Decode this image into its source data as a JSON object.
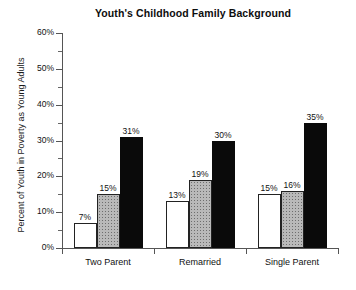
{
  "chart_data": {
    "type": "bar",
    "title": "Youth's Childhood Family Background",
    "xlabel": "",
    "ylabel": "Percent of Youth in Poverty as Young Adults",
    "ylim": [
      0,
      60
    ],
    "ytick_labels": [
      "0%",
      "10%",
      "20%",
      "30%",
      "40%",
      "50%",
      "60%"
    ],
    "ytick_values": [
      0,
      10,
      20,
      30,
      40,
      50,
      60
    ],
    "yminor_values": [
      5,
      15,
      25,
      35,
      45,
      55
    ],
    "grid": false,
    "legend": "none",
    "categories": [
      "Two Parent",
      "Remarried",
      "Single Parent"
    ],
    "series": [
      {
        "name": "series-1",
        "fill": "white",
        "values": [
          7,
          13,
          15
        ],
        "labels": [
          "7%",
          "13%",
          "15%"
        ]
      },
      {
        "name": "series-2",
        "fill": "gray",
        "values": [
          15,
          19,
          16
        ],
        "labels": [
          "15%",
          "19%",
          "16%"
        ]
      },
      {
        "name": "series-3",
        "fill": "black",
        "values": [
          31,
          30,
          35
        ],
        "labels": [
          "31%",
          "30%",
          "35%"
        ]
      }
    ],
    "colors": {
      "series_1_fill": "#ffffff",
      "series_2_fill": "#b9b9b9",
      "series_3_fill": "#0a0a0a",
      "axis": "#555555",
      "text": "#111111",
      "background": "#ffffff"
    }
  }
}
